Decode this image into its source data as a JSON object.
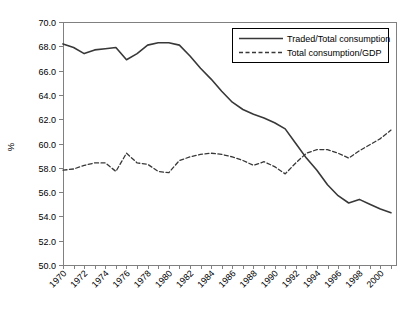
{
  "chart_data": {
    "type": "line",
    "title": "",
    "xlabel": "",
    "ylabel": "%",
    "ylim": [
      50.0,
      70.0
    ],
    "y_tick_step": 2.0,
    "y_tick_labels": [
      "70.0",
      "68.0",
      "66.0",
      "64.0",
      "62.0",
      "60.0",
      "58.0",
      "56.0",
      "54.0",
      "52.0",
      "50.0"
    ],
    "x": [
      1970,
      1971,
      1972,
      1973,
      1974,
      1975,
      1976,
      1977,
      1978,
      1979,
      1980,
      1981,
      1982,
      1983,
      1984,
      1985,
      1986,
      1987,
      1988,
      1989,
      1990,
      1991,
      1992,
      1993,
      1994,
      1995,
      1996,
      1997,
      1998,
      1999,
      2000,
      2001
    ],
    "x_tick_labels": [
      "1970",
      "1972",
      "1974",
      "1976",
      "1978",
      "1980",
      "1982",
      "1984",
      "1986",
      "1988",
      "1990",
      "1992",
      "1994",
      "1996",
      "1998",
      "2000"
    ],
    "grid": false,
    "legend_position": "top-right-inside",
    "series": [
      {
        "name": "Traded/Total consumption",
        "style": "solid",
        "color": "#383838",
        "values": [
          68.2,
          67.9,
          67.4,
          67.7,
          67.8,
          67.9,
          66.9,
          67.4,
          68.1,
          68.3,
          68.3,
          68.1,
          67.2,
          66.2,
          65.3,
          64.3,
          63.4,
          62.8,
          62.4,
          62.1,
          61.7,
          61.2,
          60.0,
          58.8,
          57.8,
          56.6,
          55.7,
          55.1,
          55.4,
          55.0,
          54.6,
          54.3
        ]
      },
      {
        "name": "Total consumption/GDP",
        "style": "dashed",
        "color": "#383838",
        "values": [
          57.8,
          57.9,
          58.2,
          58.4,
          58.4,
          57.7,
          59.2,
          58.4,
          58.3,
          57.7,
          57.6,
          58.6,
          58.9,
          59.1,
          59.2,
          59.1,
          58.9,
          58.6,
          58.2,
          58.5,
          58.1,
          57.5,
          58.4,
          59.2,
          59.5,
          59.5,
          59.2,
          58.8,
          59.4,
          59.9,
          60.4,
          61.1
        ]
      }
    ]
  },
  "colors": {
    "background": "#ffffff",
    "axis": "#808080",
    "text": "#000000",
    "series": "#383838",
    "legend_border": "#000000"
  }
}
